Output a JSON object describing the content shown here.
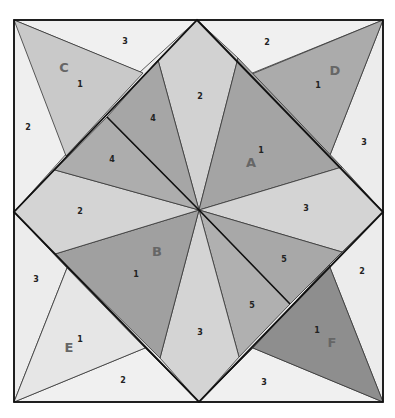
{
  "diagram": {
    "type": "quilt-block-pattern",
    "colors": {
      "background": "#ffffff",
      "very_light": "#ececec",
      "light": "#d6d6d6",
      "medium": "#b9b9b9",
      "dark": "#9c9c9c",
      "darker": "#8e8e8e",
      "outline": "#111111"
    },
    "sections": {
      "A": {
        "letter": "A",
        "piece": "1"
      },
      "B": {
        "letter": "B",
        "piece": "1"
      },
      "C": {
        "letter": "C",
        "piece": "1"
      },
      "D": {
        "letter": "D",
        "piece": "1"
      },
      "E": {
        "letter": "E",
        "piece": "1"
      },
      "F": {
        "letter": "F",
        "piece": "1"
      }
    },
    "labels": {
      "c_top_3": "3",
      "c_left_2": "2",
      "d_top_2": "2",
      "d_right_3": "3",
      "e_left_3": "3",
      "e_bottom_2": "2",
      "f_right_2": "2",
      "f_bottom_3": "3",
      "center_top_2": "2",
      "center_left_2": "2",
      "center_right_3": "3",
      "center_bottom_3": "3",
      "upper_left_4a": "4",
      "upper_left_4b": "4",
      "lower_right_5a": "5",
      "lower_right_5b": "5"
    }
  }
}
